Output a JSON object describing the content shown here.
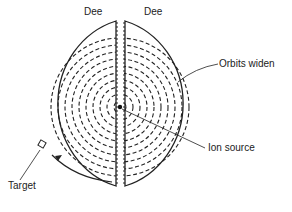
{
  "diagram": {
    "labels": {
      "dee_left": "Dee",
      "dee_right": "Dee",
      "orbits": "Orbits widen",
      "ion_source": "Ion source",
      "target": "Target"
    },
    "colors": {
      "stroke": "#222222",
      "background": "#ffffff"
    }
  }
}
